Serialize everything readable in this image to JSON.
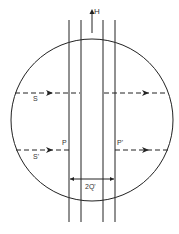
{
  "labels": {
    "h": "H",
    "s_upper": "S",
    "s_lower": "S'",
    "p_left": "P",
    "p_right": "P'",
    "width": "2Q'"
  },
  "colors": {
    "stroke": "#222222",
    "text": "#333333"
  }
}
